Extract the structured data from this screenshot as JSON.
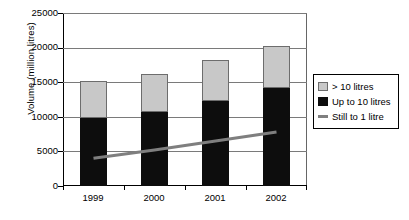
{
  "chart_data": {
    "type": "bar",
    "title": "",
    "xlabel": "",
    "ylabel": "Volume (million litres)",
    "ylim": [
      0,
      25000
    ],
    "yticks": [
      0,
      5000,
      10000,
      15000,
      20000,
      25000
    ],
    "ytick_labels": [
      "0",
      "5000",
      "10000",
      "15000",
      "20000",
      "25000"
    ],
    "categories": [
      "1999",
      "2000",
      "2001",
      "2002"
    ],
    "grid": true,
    "stacked": true,
    "legend_position": "right",
    "series": [
      {
        "name": "> 10 litres",
        "type": "bar",
        "color": "#c8c8c8",
        "values": [
          5400,
          5600,
          5900,
          6100
        ]
      },
      {
        "name": "Up to 10 litres",
        "type": "bar",
        "color": "#0d0d0d",
        "values": [
          9900,
          10700,
          12400,
          14300
        ]
      },
      {
        "name": "Still to 1 litre",
        "type": "line",
        "color": "#7f7f7f",
        "values": [
          3900,
          5100,
          6400,
          7700
        ]
      }
    ],
    "bar_totals": [
      15300,
      16300,
      18300,
      20400
    ]
  },
  "legend": {
    "items": [
      {
        "label": "> 10 litres",
        "swatch": "filled-square-gray-icon"
      },
      {
        "label": "Up to 10 litres",
        "swatch": "filled-square-black-icon"
      },
      {
        "label": "Still to 1 litre",
        "swatch": "line-gray-icon"
      }
    ]
  },
  "caption": {
    "text": ""
  }
}
